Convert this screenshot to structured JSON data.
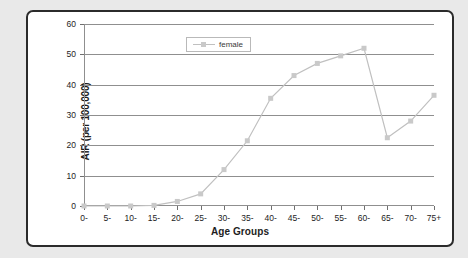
{
  "chart_data": {
    "type": "line",
    "title": "",
    "xlabel": "Age Groups",
    "ylabel": "AIR (per 100,000)",
    "categories": [
      "0-",
      "5-",
      "10-",
      "15-",
      "20-",
      "25-",
      "30-",
      "35-",
      "40-",
      "45-",
      "50-",
      "55-",
      "60-",
      "65-",
      "70-",
      "75+"
    ],
    "series": [
      {
        "name": "female",
        "values": [
          0,
          0,
          0,
          0.2,
          1.5,
          4,
          12,
          21.5,
          35.5,
          43,
          47,
          49.5,
          52,
          22.5,
          28,
          36.5
        ]
      }
    ],
    "ylim": [
      0,
      60
    ],
    "yticks": [
      0,
      10,
      20,
      30,
      40,
      50,
      60
    ],
    "ytick_labels": [
      "0",
      "10",
      "20",
      "30",
      "40",
      "50",
      "60"
    ],
    "grid": true,
    "legend_position": "top-center",
    "colors": {
      "series_line": "#c0c0c0",
      "series_marker": "#c9c9c9",
      "gridline": "#8f8f8f",
      "axis": "#8f8f8f",
      "text": "#1d1d1d",
      "frame_border": "#2b2b2b",
      "page_background": "#e9e9e9",
      "plot_background": "#ffffff"
    }
  },
  "legend": {
    "entries": [
      {
        "label": "female"
      }
    ]
  }
}
